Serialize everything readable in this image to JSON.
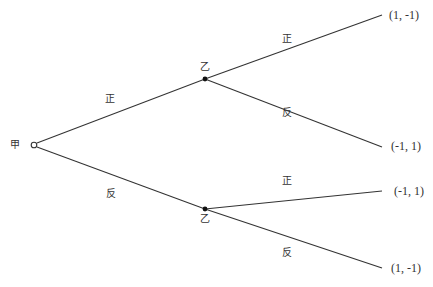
{
  "diagram": {
    "type": "game-tree",
    "root": {
      "label": "甲"
    },
    "nodes": [
      {
        "id": "upper",
        "label": "乙"
      },
      {
        "id": "lower",
        "label": "乙"
      }
    ],
    "edges": {
      "root_upper": "正",
      "root_lower": "反",
      "upper_top": "正",
      "upper_bottom": "反",
      "lower_top": "正",
      "lower_bottom": "反"
    },
    "payoffs": [
      "(1, -1)",
      "(-1, 1)",
      "(-1, 1)",
      "(1, -1)"
    ]
  },
  "colors": {
    "line": "#333333",
    "text": "#333333",
    "background": "#ffffff"
  }
}
